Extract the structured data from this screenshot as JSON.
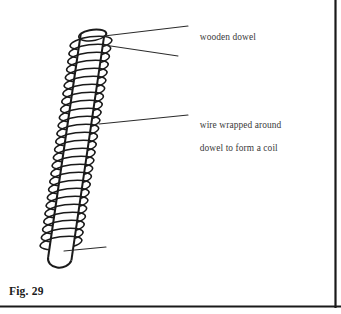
{
  "figure": {
    "caption": "Fig. 29",
    "labels": [
      {
        "id": "wooden-dowel",
        "text": "wooden dowel",
        "lines": [
          "wooden dowel"
        ]
      },
      {
        "id": "wire-coil",
        "text": "wire wrapped around dowel to form a coil",
        "lines": [
          "wire wrapped around",
          "dowel to form a coil"
        ]
      }
    ],
    "leader_lines": [
      {
        "id": "leader-wooden-dowel-top",
        "from_x": 104,
        "from_y": 36,
        "to_x": 188,
        "to_y": 26
      },
      {
        "id": "leader-wooden-dowel-lower",
        "from_x": 104,
        "from_y": 45,
        "to_x": 178,
        "to_y": 56
      },
      {
        "id": "leader-wire-coil",
        "from_x": 99,
        "from_y": 124,
        "to_x": 188,
        "to_y": 115
      },
      {
        "id": "leader-dowel-base",
        "from_x": 64,
        "from_y": 251,
        "to_x": 106,
        "to_y": 247
      }
    ],
    "dowel": {
      "top_center_x": 92,
      "top_center_y": 33,
      "bottom_center_x": 59,
      "bottom_center_y": 258,
      "width": 24,
      "tilt_degrees": 8
    },
    "coil": {
      "turns": 26,
      "top_y": 40,
      "bottom_y": 246,
      "ellipse_rx": 21,
      "ellipse_ry": 6
    },
    "colors": {
      "ink": "#1a1a1a",
      "label_text": "#3a3a3a",
      "leader_line": "#2b2b2b",
      "background": "#ffffff",
      "frame": "#1a1a1a"
    }
  },
  "frame": {
    "right_rule_x": 335,
    "bottom_rule_y": 306,
    "visible_sides": "right and bottom"
  }
}
